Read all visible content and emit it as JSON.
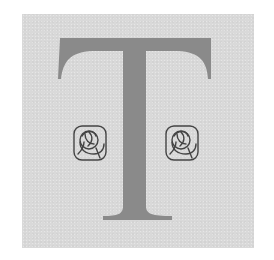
{
  "drop_cap": {
    "letter": "T",
    "panel_color": "#d9d9d9",
    "letter_color": "#8c8c8c",
    "ornament_color": "#4a4a4a"
  },
  "ornaments": [
    {
      "name": "rose-ornament-left",
      "icon": "stylized-rose"
    },
    {
      "name": "rose-ornament-right",
      "icon": "stylized-rose"
    }
  ]
}
